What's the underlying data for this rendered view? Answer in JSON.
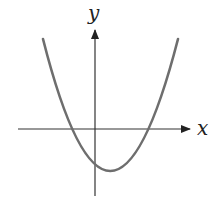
{
  "diagram": {
    "type": "function-graph",
    "axes": {
      "x_label": "x",
      "y_label": "y"
    },
    "colors": {
      "curve": "#6e6e6e",
      "axes": "#333333",
      "label": "#222222"
    }
  }
}
